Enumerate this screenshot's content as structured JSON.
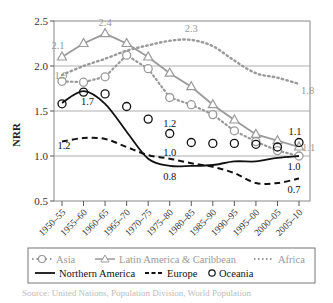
{
  "chart_data": {
    "type": "line",
    "title": "",
    "xlabel": "",
    "ylabel": "NRR",
    "ylim": [
      0.5,
      2.5
    ],
    "yticks": [
      0.5,
      1.0,
      1.5,
      2.0,
      2.5
    ],
    "grid": "horizontal",
    "legend_position": "bottom",
    "categories": [
      "1950–55",
      "1955–60",
      "1960–65",
      "1965–70",
      "1970–75",
      "1975–80",
      "1980–85",
      "1985–90",
      "1990–95",
      "1995–00",
      "2000–05",
      "2005–10"
    ],
    "series": [
      {
        "name": "Asia",
        "style": "dotted-circle",
        "color": "#999999",
        "values": [
          1.83,
          1.82,
          1.88,
          2.12,
          1.97,
          1.65,
          1.57,
          1.46,
          1.28,
          1.16,
          1.06,
          1.0
        ]
      },
      {
        "name": "Latin America & Caribbean",
        "style": "solid-triangle",
        "color": "#999999",
        "values": [
          2.1,
          2.25,
          2.36,
          2.25,
          2.1,
          1.92,
          1.77,
          1.57,
          1.4,
          1.24,
          1.17,
          1.1
        ]
      },
      {
        "name": "Africa",
        "style": "dotted",
        "color": "#999999",
        "values": [
          1.9,
          2.0,
          2.08,
          2.17,
          2.23,
          2.28,
          2.29,
          2.22,
          2.06,
          1.92,
          1.87,
          1.8
        ]
      },
      {
        "name": "Northern America",
        "style": "solid",
        "color": "#111111",
        "values": [
          1.59,
          1.72,
          1.58,
          1.27,
          0.97,
          0.89,
          0.89,
          0.9,
          0.94,
          0.94,
          0.98,
          1.0
        ]
      },
      {
        "name": "Europe",
        "style": "dashed",
        "color": "#111111",
        "values": [
          1.16,
          1.2,
          1.19,
          1.1,
          1.01,
          0.97,
          0.92,
          0.88,
          0.81,
          0.7,
          0.7,
          0.75
        ]
      },
      {
        "name": "Oceania",
        "style": "circle-markers",
        "color": "#111111",
        "values": [
          1.58,
          1.71,
          1.69,
          1.55,
          1.41,
          1.25,
          1.15,
          1.14,
          1.14,
          1.13,
          1.1,
          1.15
        ]
      }
    ],
    "annotations": [
      {
        "text": "2.1",
        "series": "Latin America & Caribbean",
        "category": "1950–55"
      },
      {
        "text": "2.4",
        "series": "Latin America & Caribbean",
        "category": "1960–65"
      },
      {
        "text": "1.1",
        "series": "Latin America & Caribbean",
        "category": "2005–10"
      },
      {
        "text": "1.9",
        "series": "Africa",
        "category": "1950–55"
      },
      {
        "text": "2.3",
        "series": "Africa",
        "category": "1980–85"
      },
      {
        "text": "1.8",
        "series": "Africa",
        "category": "2005–10"
      },
      {
        "text": "1.7",
        "series": "Northern America",
        "category": "1955–60"
      },
      {
        "text": "0.8",
        "series": "Northern America",
        "category": "1975–80"
      },
      {
        "text": "1.0",
        "series": "Northern America",
        "category": "2005–10"
      },
      {
        "text": "1.2",
        "series": "Europe",
        "category": "1950–55"
      },
      {
        "text": "1.0",
        "series": "Europe",
        "category": "1975–80"
      },
      {
        "text": "0.7",
        "series": "Europe",
        "category": "2005–10"
      },
      {
        "text": "1.2",
        "series": "Oceania",
        "category": "1975–80"
      },
      {
        "text": "1.1",
        "series": "Oceania",
        "category": "2005–10"
      }
    ]
  },
  "legend": {
    "items": [
      {
        "label": "Asia",
        "color": "#999999"
      },
      {
        "label": "Latin America & Caribbean",
        "color": "#999999"
      },
      {
        "label": "Africa",
        "color": "#999999"
      },
      {
        "label": "Northern America",
        "color": "#111111"
      },
      {
        "label": "Europe",
        "color": "#111111"
      },
      {
        "label": "Oceania",
        "color": "#111111"
      }
    ]
  },
  "caption": "Source: United Nations, Population Division, World Population"
}
